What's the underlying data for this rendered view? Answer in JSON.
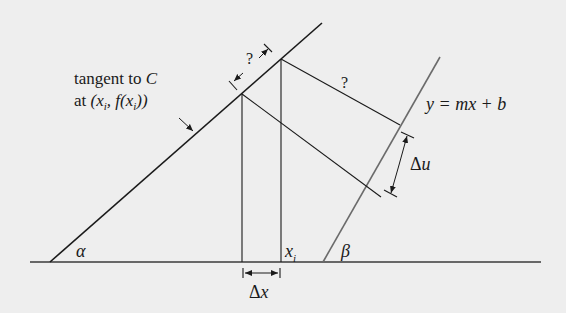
{
  "diagram": {
    "type": "geometric-construction",
    "colors": {
      "background": "#eeeeee",
      "line_dark": "#1a1a1a",
      "line_gray": "#6b6b6b"
    },
    "labels": {
      "tangent_line1": "tangent to ",
      "tangent_C": "C",
      "tangent_line2_prefix": "at ",
      "tangent_point": "(x",
      "tangent_point_sub": "i",
      "tangent_point_mid": ", f(x",
      "tangent_point_sub2": "i",
      "tangent_point_end": "))",
      "question_top": "?",
      "question_mid": "?",
      "line_equation": "y = mx + b",
      "delta_u": "Δu",
      "delta_u_delta": "Δ",
      "delta_u_var": "u",
      "delta_x_delta": "Δ",
      "delta_x_var": "x",
      "x_i": "x",
      "x_i_sub": "i",
      "alpha": "α",
      "beta": "β"
    },
    "elements": [
      "baseline",
      "tangent-line",
      "line-y-mx-b",
      "vertical-at-xi-minus",
      "vertical-at-xi",
      "perpendicular-upper",
      "perpendicular-lower",
      "dimension-question-top",
      "dimension-delta-u",
      "dimension-delta-x",
      "tangent-pointer-arrow"
    ]
  }
}
